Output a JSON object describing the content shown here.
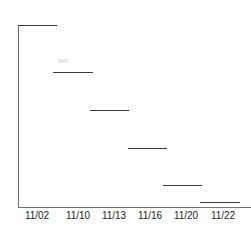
{
  "chart_data": {
    "type": "line",
    "subtype": "step",
    "title": "",
    "subtitle": "",
    "xlabel": "",
    "ylabel": "",
    "grid": false,
    "legend": null,
    "legend_position": "none",
    "categories": [
      "11/02",
      "11/10",
      "11/13",
      "11/16",
      "11/20",
      "11/22"
    ],
    "x_tick_labels": [
      "11/02",
      "11/10",
      "11/13",
      "11/16",
      "11/20",
      "11/22"
    ],
    "y_tick_labels": [],
    "xlim": [
      0,
      6
    ],
    "ylim": [
      0,
      100
    ],
    "values": [
      100,
      74,
      53,
      32,
      12,
      3
    ],
    "series": [
      {
        "name": "step-series",
        "values": [
          100,
          74,
          53,
          32,
          12,
          3
        ],
        "color": "#3a3a3a"
      }
    ],
    "steps": [
      {
        "label": "11/02",
        "value": 100,
        "x_start_px": 18,
        "x_end_px": 57,
        "y_px": 25
      },
      {
        "label": "11/10",
        "value": 74,
        "x_start_px": 53,
        "x_end_px": 93,
        "y_px": 72
      },
      {
        "label": "11/13",
        "value": 53,
        "x_start_px": 90,
        "x_end_px": 129,
        "y_px": 110
      },
      {
        "label": "11/16",
        "value": 32,
        "x_start_px": 128,
        "x_end_px": 167,
        "y_px": 148
      },
      {
        "label": "11/20",
        "value": 12,
        "x_start_px": 163,
        "x_end_px": 202,
        "y_px": 185
      },
      {
        "label": "11/22",
        "value": 3,
        "x_start_px": 200,
        "x_end_px": 240,
        "y_px": 202
      }
    ],
    "tick_positions_px": [
      37,
      78,
      114,
      150,
      186,
      223
    ],
    "axis_color": "#6e6e6e",
    "line_color": "#3a3a3a",
    "background_color": "#ffffff"
  }
}
